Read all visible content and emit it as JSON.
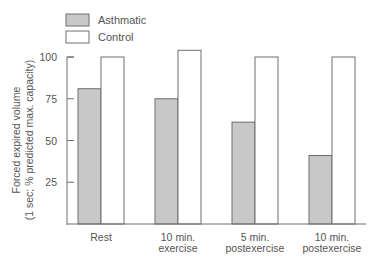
{
  "chart_data": {
    "type": "bar",
    "title": "",
    "xlabel": "",
    "ylabel": "Forced expired volume",
    "ylabel_sub": "(1 sec; % predicted max. capacity)",
    "categories": [
      [
        "Rest"
      ],
      [
        "10 min.",
        "exercise"
      ],
      [
        "5 min.",
        "postexercise"
      ],
      [
        "10 min.",
        "postexercise"
      ]
    ],
    "series": [
      {
        "name": "Asthmatic",
        "color": "#c8c8c8",
        "values": [
          81,
          75,
          61,
          41
        ]
      },
      {
        "name": "Control",
        "color": "#ffffff",
        "values": [
          100,
          104,
          100,
          100
        ]
      }
    ],
    "ylim": [
      0,
      100
    ],
    "yticks": [
      25,
      50,
      75,
      100
    ],
    "grid": false,
    "legend_position": "top-left"
  }
}
